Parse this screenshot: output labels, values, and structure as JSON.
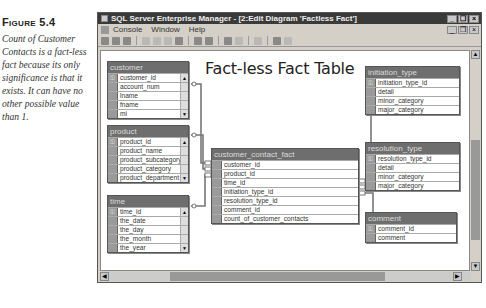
{
  "caption": {
    "figure_label": "Figure 5.4",
    "text": "Count of Customer Contacts is a fact-less fact because its only significance is that it exists. It can have no other possible value than 1."
  },
  "window": {
    "title": "SQL Server Enterprise Manager - [2:Edit Diagram 'Factless Fact']",
    "controls": {
      "minimize": "_",
      "restore": "❐",
      "close": "×"
    }
  },
  "menubar": {
    "items": [
      "Console",
      "Window",
      "Help"
    ]
  },
  "toolbar": {
    "icons": [
      "save-icon",
      "print-setup-icon",
      "print-icon",
      "copy-icon",
      "cut-icon",
      "paste-icon",
      "properties-icon",
      "new-table-icon",
      "add-table-icon",
      "zoom-icon",
      "layout-icon",
      "key-icon",
      "label-icon",
      "relationship-icon"
    ]
  },
  "diagram": {
    "title": "Fact-less Fact Table",
    "tables": [
      {
        "name": "customer",
        "columns": [
          {
            "name": "customer_id",
            "key": true
          },
          {
            "name": "account_num"
          },
          {
            "name": "lname"
          },
          {
            "name": "fname"
          },
          {
            "name": "mi"
          }
        ]
      },
      {
        "name": "product",
        "columns": [
          {
            "name": "product_id",
            "key": true
          },
          {
            "name": "product_name"
          },
          {
            "name": "product_subcategory"
          },
          {
            "name": "product_category"
          },
          {
            "name": "product_department"
          }
        ]
      },
      {
        "name": "time",
        "columns": [
          {
            "name": "time_id",
            "key": true
          },
          {
            "name": "the_date"
          },
          {
            "name": "the_day"
          },
          {
            "name": "the_month"
          },
          {
            "name": "the_year"
          }
        ]
      },
      {
        "name": "customer_contact_fact",
        "columns": [
          {
            "name": "customer_id"
          },
          {
            "name": "product_id"
          },
          {
            "name": "time_id"
          },
          {
            "name": "initiation_type_id"
          },
          {
            "name": "resolution_type_id"
          },
          {
            "name": "comment_id"
          },
          {
            "name": "count_of_customer_contacts"
          }
        ]
      },
      {
        "name": "initiation_type",
        "columns": [
          {
            "name": "initiation_type_id",
            "key": true
          },
          {
            "name": "detail"
          },
          {
            "name": "minor_category"
          },
          {
            "name": "major_category"
          }
        ]
      },
      {
        "name": "resolution_type",
        "columns": [
          {
            "name": "resolution_type_id",
            "key": true
          },
          {
            "name": "detail"
          },
          {
            "name": "minor_category"
          },
          {
            "name": "major_category"
          }
        ]
      },
      {
        "name": "comment",
        "columns": [
          {
            "name": "comment_id",
            "key": true
          },
          {
            "name": "comment"
          }
        ]
      }
    ]
  },
  "glyphs": {
    "key": "⚿",
    "scroll_up": "▲",
    "scroll_down": "▼",
    "scroll_left": "◀",
    "scroll_right": "▶"
  }
}
